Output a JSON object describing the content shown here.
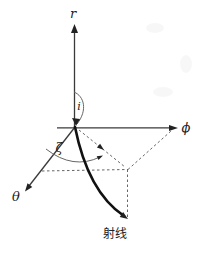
{
  "diagram": {
    "labels": {
      "r_axis": "r",
      "phi_axis": "ϕ",
      "theta_axis": "θ",
      "incidence_angle": "i",
      "azimuth_angle": "ζ",
      "ray": "射线"
    },
    "colors": {
      "background": "#ffffff",
      "axis": "#3a3a3a",
      "ray": "#111111",
      "dashed": "#666666",
      "arc": "#666666",
      "text": "#222222"
    }
  }
}
